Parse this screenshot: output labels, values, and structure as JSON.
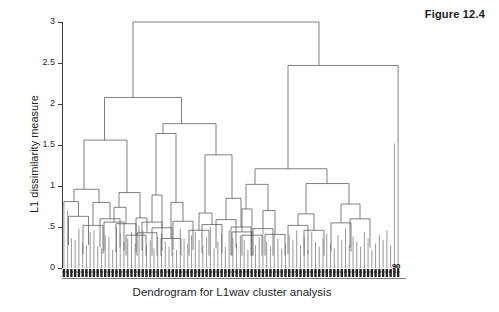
{
  "figure": {
    "title": "Figure 12.4"
  },
  "chart_data": {
    "type": "dendrogram",
    "title": "",
    "xlabel": "Dendrogram for L1wav cluster analysis",
    "ylabel": "L1 dissimilarity measure",
    "ylim": [
      0,
      3
    ],
    "yticks": [
      0,
      0.5,
      1,
      1.5,
      2,
      2.5,
      3
    ],
    "ytick_labels": [
      "0",
      ".5",
      "1",
      "1.5",
      "2",
      "2.5",
      "3"
    ],
    "grid": false,
    "legend": null,
    "n_leaves": 90,
    "leaf_axis_end_label": "90",
    "line_color": "#55565a",
    "axis_color": "#3a3a3a",
    "merges": [
      {
        "id": "m1",
        "x": 176.5,
        "y": 3.0,
        "left": "m2",
        "right": "m3"
      },
      {
        "id": "m2",
        "x": 133.0,
        "y": 2.08,
        "left": "m4",
        "right": "m5"
      },
      {
        "id": "m3",
        "x": 319.0,
        "y": 2.47,
        "left": "m6",
        "right": "L89"
      },
      {
        "id": "m4",
        "x": 104.5,
        "y": 1.56,
        "left": "m7",
        "right": "m8"
      },
      {
        "id": "m5",
        "x": 181.5,
        "y": 1.76,
        "left": "m9",
        "right": "m10"
      },
      {
        "id": "m6",
        "x": 288.0,
        "y": 1.21,
        "left": "m11",
        "right": "m12"
      },
      {
        "id": "m7",
        "x": 84.0,
        "y": 0.96,
        "left": "m13",
        "right": "m14"
      },
      {
        "id": "m8",
        "x": 127.0,
        "y": 0.92,
        "left": "m15",
        "right": "m16"
      },
      {
        "id": "m9",
        "x": 163.0,
        "y": 1.64,
        "left": "m17",
        "right": "m18"
      },
      {
        "id": "m10",
        "x": 216.0,
        "y": 1.38,
        "left": "m19",
        "right": "m20"
      },
      {
        "id": "m11",
        "x": 255.0,
        "y": 1.02,
        "left": "m21",
        "right": "m22"
      },
      {
        "id": "m12",
        "x": 327.0,
        "y": 1.03,
        "left": "m23",
        "right": "m24"
      },
      {
        "id": "m13",
        "x": 74.0,
        "y": 0.81,
        "left": "L0",
        "right": "m25"
      },
      {
        "id": "m14",
        "x": 99.0,
        "y": 0.8,
        "left": "m26",
        "right": "m27"
      },
      {
        "id": "m15",
        "x": 119.0,
        "y": 0.74,
        "left": "m28",
        "right": "m29"
      },
      {
        "id": "m16",
        "x": 140.0,
        "y": 0.61,
        "left": "m30",
        "right": "m31"
      },
      {
        "id": "m17",
        "x": 156.0,
        "y": 0.89,
        "left": "m32",
        "right": "m33"
      },
      {
        "id": "m18",
        "x": 176.0,
        "y": 0.8,
        "left": "m34",
        "right": "m35"
      },
      {
        "id": "m19",
        "x": 205.0,
        "y": 0.67,
        "left": "m36",
        "right": "m37"
      },
      {
        "id": "m20",
        "x": 232.0,
        "y": 0.85,
        "left": "m38",
        "right": "m39"
      },
      {
        "id": "m21",
        "x": 246.0,
        "y": 0.72,
        "left": "m40",
        "right": "m41"
      },
      {
        "id": "m22",
        "x": 268.0,
        "y": 0.7,
        "left": "m42",
        "right": "m43"
      },
      {
        "id": "m23",
        "x": 306.0,
        "y": 0.66,
        "left": "m44",
        "right": "m45"
      },
      {
        "id": "m24",
        "x": 349.0,
        "y": 0.78,
        "left": "m46",
        "right": "m47"
      },
      {
        "id": "m25",
        "x": 78.5,
        "y": 0.63,
        "left": "m48",
        "right": "m49"
      },
      {
        "id": "m26",
        "x": 93.0,
        "y": 0.52,
        "left": "m50",
        "right": "m51"
      },
      {
        "id": "m27",
        "x": 110.0,
        "y": 0.6,
        "left": "m52",
        "right": "m53"
      },
      {
        "id": "m28",
        "x": 114.0,
        "y": 0.56,
        "left": "m54",
        "right": "m55"
      },
      {
        "id": "m29",
        "x": 126.0,
        "y": 0.54,
        "left": "m56",
        "right": "m57"
      },
      {
        "id": "m30",
        "x": 136.0,
        "y": 0.4,
        "left": "m58",
        "right": "m59"
      },
      {
        "id": "m31",
        "x": 147.0,
        "y": 0.43,
        "left": "m60",
        "right": "m61"
      },
      {
        "id": "m32",
        "x": 152.0,
        "y": 0.56,
        "left": "m62",
        "right": "m63"
      },
      {
        "id": "m33",
        "x": 162.0,
        "y": 0.49,
        "left": "m64",
        "right": "m65"
      },
      {
        "id": "m34",
        "x": 171.0,
        "y": 0.36,
        "left": "m66",
        "right": "m67"
      },
      {
        "id": "m35",
        "x": 183.0,
        "y": 0.57,
        "left": "m68",
        "right": "m69"
      },
      {
        "id": "m36",
        "x": 199.0,
        "y": 0.46,
        "left": "m70",
        "right": "m71"
      },
      {
        "id": "m37",
        "x": 212.0,
        "y": 0.53,
        "left": "m72",
        "right": "m73"
      },
      {
        "id": "m38",
        "x": 226.0,
        "y": 0.59,
        "left": "m74",
        "right": "m75"
      },
      {
        "id": "m39",
        "x": 241.0,
        "y": 0.5,
        "left": "m76",
        "right": "m77"
      },
      {
        "id": "m40",
        "x": 242.0,
        "y": 0.44,
        "left": "m78",
        "right": "m79"
      },
      {
        "id": "m41",
        "x": 252.0,
        "y": 0.4,
        "left": "m80",
        "right": "m81"
      },
      {
        "id": "m42",
        "x": 263.0,
        "y": 0.48,
        "left": "m82",
        "right": "m83"
      },
      {
        "id": "m43",
        "x": 275.0,
        "y": 0.41,
        "left": "m84",
        "right": "m85"
      },
      {
        "id": "m44",
        "x": 298.0,
        "y": 0.52,
        "left": "m86",
        "right": "m87"
      },
      {
        "id": "m45",
        "x": 314.0,
        "y": 0.46,
        "left": "m88",
        "right": "m89"
      },
      {
        "id": "m46",
        "x": 341.0,
        "y": 0.55,
        "left": "m90",
        "right": "m91"
      },
      {
        "id": "m47",
        "x": 360.0,
        "y": 0.6,
        "left": "m92",
        "right": "m93"
      }
    ],
    "leaf_heights": [
      0.74,
      0.7,
      0.36,
      0.34,
      0.48,
      0.3,
      0.28,
      0.44,
      0.46,
      0.26,
      0.24,
      0.4,
      0.38,
      0.22,
      0.5,
      0.42,
      0.32,
      0.36,
      0.44,
      0.3,
      0.52,
      0.46,
      0.28,
      0.34,
      0.24,
      0.38,
      0.42,
      0.32,
      0.26,
      0.2,
      0.22,
      0.48,
      0.36,
      0.3,
      0.4,
      0.44,
      0.34,
      0.28,
      0.38,
      0.5,
      0.24,
      0.32,
      0.42,
      0.26,
      0.46,
      0.36,
      0.3,
      0.4,
      0.34,
      0.22,
      0.44,
      0.28,
      0.38,
      0.48,
      0.32,
      0.26,
      0.42,
      0.36,
      0.24,
      0.3,
      0.4,
      0.34,
      0.46,
      0.28,
      0.38,
      0.22,
      0.44,
      0.32,
      0.26,
      0.36,
      0.42,
      0.3,
      0.24,
      0.4,
      0.34,
      0.48,
      0.28,
      0.38,
      0.32,
      0.26,
      0.44,
      0.36,
      0.22,
      0.3,
      0.4,
      0.34,
      0.46,
      0.28,
      1.52,
      1.52
    ]
  }
}
